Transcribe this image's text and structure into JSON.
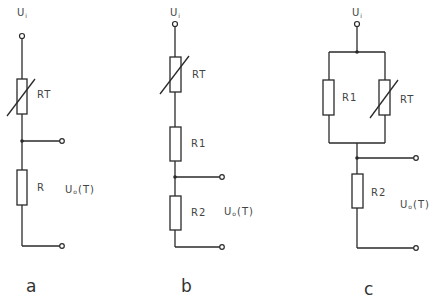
{
  "figure": {
    "circuits": [
      {
        "id": "a",
        "caption": "a",
        "input_label": "U",
        "input_sub": "i",
        "output_label": "U",
        "output_sub": "o",
        "output_suffix": "(T)",
        "components": [
          {
            "name": "RT",
            "type": "thermistor"
          },
          {
            "name": "R",
            "type": "resistor"
          }
        ]
      },
      {
        "id": "b",
        "caption": "b",
        "input_label": "U",
        "input_sub": "i",
        "output_label": "U",
        "output_sub": "o",
        "output_suffix": "(T)",
        "components": [
          {
            "name": "RT",
            "type": "thermistor"
          },
          {
            "name": "R1",
            "type": "resistor"
          },
          {
            "name": "R2",
            "type": "resistor"
          }
        ]
      },
      {
        "id": "c",
        "caption": "c",
        "input_label": "U",
        "input_sub": "i",
        "output_label": "U",
        "output_sub": "o",
        "output_suffix": "(T)",
        "components": [
          {
            "name": "R1",
            "type": "resistor"
          },
          {
            "name": "RT",
            "type": "thermistor"
          },
          {
            "name": "R2",
            "type": "resistor"
          }
        ]
      }
    ],
    "colors": {
      "line": "#2a2a2a",
      "text": "#444444",
      "background": "#ffffff"
    }
  }
}
